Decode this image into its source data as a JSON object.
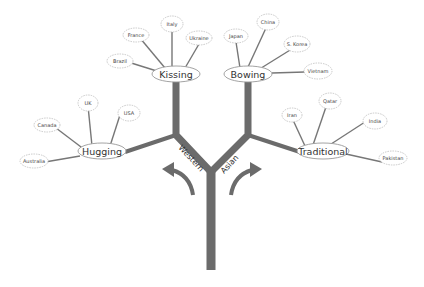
{
  "diagram": {
    "type": "tree",
    "colors": {
      "trunk": "#6b6b6b",
      "line": "#6b6b6b",
      "node_border": "#b0b0b0",
      "text": "#333333"
    },
    "branches": {
      "western": {
        "label": "Western"
      },
      "asian": {
        "label": "Asian"
      }
    },
    "hubs": {
      "kissing": {
        "label": "Kissing",
        "leaves": [
          "Brazil",
          "France",
          "Italy",
          "Ukraine"
        ]
      },
      "hugging": {
        "label": "Hugging",
        "leaves": [
          "Canada",
          "UK",
          "USA",
          "Australia"
        ]
      },
      "bowing": {
        "label": "Bowing",
        "leaves": [
          "Japan",
          "China",
          "S. Korea",
          "Vietnam"
        ]
      },
      "traditional": {
        "label": "Traditional",
        "leaves": [
          "Iran",
          "Qatar",
          "India",
          "Pakistan"
        ]
      }
    }
  }
}
